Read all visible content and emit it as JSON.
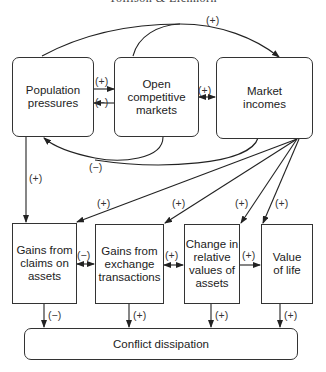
{
  "header": {
    "running_title": "Tollison & Eichhorn"
  },
  "nodes": {
    "population_pressures": "Population\npressures",
    "open_markets": "Open\ncompetitive\nmarkets",
    "market_incomes": "Market\nincomes",
    "gains_claims": "Gains from\nclaims on\nassets",
    "gains_exchange": "Gains from\nexchange\ntransactions",
    "change_relative": "Change in\nrelative\nvalues of\nassets",
    "value_of_life": "Value\nof life",
    "conflict_dissipation": "Conflict dissipation"
  },
  "edges": [
    {
      "from": "population_pressures",
      "to": "market_incomes",
      "sign": "(+)"
    },
    {
      "from": "open_markets",
      "to": "market_incomes",
      "sign": "(+)"
    },
    {
      "from": "population_pressures",
      "to": "open_markets",
      "sign": "(+)"
    },
    {
      "from": "open_markets",
      "to": "population_pressures",
      "sign": "(−)"
    },
    {
      "from": "open_markets",
      "to": "market_incomes",
      "sign": "(+)",
      "bidirectional": true
    },
    {
      "from": "open_markets",
      "to": "population_pressures",
      "sign": "(−)",
      "via": "lower-curve"
    },
    {
      "from": "market_incomes",
      "to": "population_pressures",
      "sign": "(−)",
      "via": "lower-curve"
    },
    {
      "from": "population_pressures",
      "to": "gains_claims",
      "sign": "(+)"
    },
    {
      "from": "market_incomes",
      "to": "gains_claims",
      "sign": "(+)"
    },
    {
      "from": "market_incomes",
      "to": "gains_exchange",
      "sign": "(+)"
    },
    {
      "from": "market_incomes",
      "to": "change_relative",
      "sign": "(+)"
    },
    {
      "from": "market_incomes",
      "to": "value_of_life",
      "sign": "(+)"
    },
    {
      "from": "gains_claims",
      "to": "gains_exchange",
      "sign": "(−)",
      "bidirectional": true
    },
    {
      "from": "gains_exchange",
      "to": "change_relative",
      "sign": "(+)",
      "bidirectional": true
    },
    {
      "from": "change_relative",
      "to": "value_of_life",
      "sign": "(+)"
    },
    {
      "from": "gains_claims",
      "to": "conflict_dissipation",
      "sign": "(−)"
    },
    {
      "from": "gains_exchange",
      "to": "conflict_dissipation",
      "sign": "(+)"
    },
    {
      "from": "change_relative",
      "to": "conflict_dissipation",
      "sign": "(+)"
    },
    {
      "from": "value_of_life",
      "to": "conflict_dissipation",
      "sign": "(+)"
    }
  ],
  "labels": {
    "top_curve": "(+)",
    "pp_to_om": "(+)",
    "om_to_pp": "(−)",
    "om_mi": "(+)",
    "lower_curve": "(−)",
    "pp_to_gc": "(+)",
    "mi_to_gc": "(+)",
    "mi_to_ge": "(+)",
    "mi_to_cr": "(+)",
    "mi_to_vl": "(+)",
    "gc_ge": "(−)",
    "ge_cr": "(+)",
    "cr_vl": "(+)",
    "gc_cd": "(−)",
    "ge_cd": "(+)",
    "cr_cd": "(+)",
    "vl_cd": "(+)"
  }
}
